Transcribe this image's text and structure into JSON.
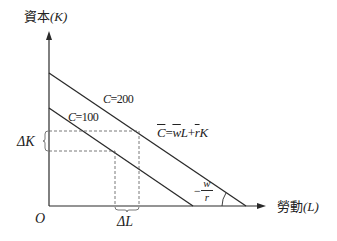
{
  "diagram": {
    "type": "isocost-lines",
    "y_axis": {
      "label_cjk": "資本",
      "label_var": "(K)"
    },
    "x_axis": {
      "label_cjk": "勞動",
      "label_var": "(L)"
    },
    "origin": "O",
    "lines": [
      {
        "name": "C=200",
        "label_var": "C",
        "label_value": "=200"
      },
      {
        "name": "C=100",
        "label_var": "C",
        "label_value": "=100"
      }
    ],
    "equation": {
      "lhs": "C",
      "eq": "=",
      "w": "w",
      "L": "L",
      "plus": "+",
      "r": "r",
      "K": "K"
    },
    "slope": {
      "sign": "−",
      "numerator": "w",
      "denominator": "r"
    },
    "delta_k": "ΔK",
    "delta_l": "ΔL",
    "colors": {
      "line": "#2a2a2a",
      "dashed": "#555555",
      "background": "#ffffff"
    }
  }
}
